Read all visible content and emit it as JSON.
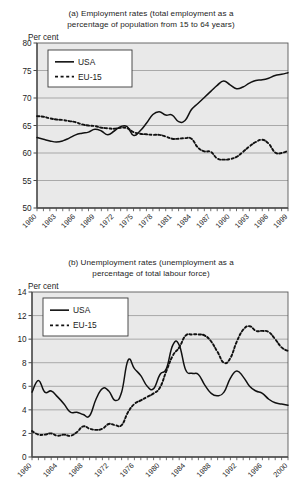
{
  "charts": [
    {
      "id": "employment-rates",
      "title_line1": "(a) Employment rates (total employment as a",
      "title_line2": "percentage of population from 15 to 64 years)",
      "unit_label": "Per cent",
      "legend": [
        {
          "label": "USA",
          "style": "solid"
        },
        {
          "label": "EU-15",
          "style": "dashed"
        }
      ]
    },
    {
      "id": "unemployment-rates",
      "title_line1": "(b) Unemployment rates (unemployment as a",
      "title_line2": "percentage of total labour force)",
      "unit_label": "Per cent",
      "legend": [
        {
          "label": "USA",
          "style": "solid"
        },
        {
          "label": "EU-15",
          "style": "dashed"
        }
      ]
    }
  ],
  "chart_data": [
    {
      "type": "line",
      "title": "(a) Employment rates (total employment as a percentage of population from 15 to 64 years)",
      "xlabel": "",
      "ylabel": "Per cent",
      "ylim": [
        50,
        80
      ],
      "yticks": [
        50,
        55,
        60,
        65,
        70,
        75,
        80
      ],
      "xlim": [
        1960,
        1999
      ],
      "xticks": [
        1960,
        1963,
        1966,
        1969,
        1972,
        1975,
        1978,
        1981,
        1984,
        1987,
        1990,
        1993,
        1996,
        1999
      ],
      "grid": true,
      "legend_position": "top-left",
      "x": [
        1960,
        1961,
        1962,
        1963,
        1964,
        1965,
        1966,
        1967,
        1968,
        1969,
        1970,
        1971,
        1972,
        1973,
        1974,
        1975,
        1976,
        1977,
        1978,
        1979,
        1980,
        1981,
        1982,
        1983,
        1984,
        1985,
        1986,
        1987,
        1988,
        1989,
        1990,
        1991,
        1992,
        1993,
        1994,
        1995,
        1996,
        1997,
        1998,
        1999
      ],
      "series": [
        {
          "name": "USA",
          "style": "solid",
          "values": [
            62.8,
            62.5,
            62.2,
            62.0,
            62.2,
            62.7,
            63.3,
            63.6,
            63.8,
            64.3,
            64.0,
            63.3,
            64.0,
            64.8,
            64.8,
            63.2,
            64.0,
            65.4,
            67.0,
            67.5,
            66.9,
            66.9,
            65.7,
            65.9,
            67.9,
            69.0,
            70.1,
            71.2,
            72.3,
            73.1,
            72.4,
            71.7,
            72.0,
            72.7,
            73.2,
            73.3,
            73.6,
            74.1,
            74.3,
            74.6
          ]
        },
        {
          "name": "EU-15",
          "style": "dashed",
          "values": [
            66.7,
            66.6,
            66.3,
            66.1,
            66.0,
            65.8,
            65.6,
            65.2,
            65.0,
            64.9,
            64.6,
            64.5,
            64.4,
            64.6,
            64.5,
            63.8,
            63.5,
            63.4,
            63.3,
            63.3,
            63.0,
            62.6,
            62.6,
            62.7,
            62.6,
            61.0,
            60.3,
            60.2,
            59.0,
            58.8,
            58.9,
            59.3,
            60.2,
            61.2,
            62.0,
            62.4,
            61.7,
            60.1,
            60.0,
            60.4
          ]
        }
      ]
    },
    {
      "type": "line",
      "title": "(b) Unemployment rates (unemployment as a percentage of total labour force)",
      "xlabel": "",
      "ylabel": "Per cent",
      "ylim": [
        0,
        14
      ],
      "yticks": [
        0,
        2,
        4,
        6,
        8,
        10,
        12,
        14
      ],
      "xlim": [
        1960,
        2000
      ],
      "xticks": [
        1960,
        1964,
        1968,
        1972,
        1976,
        1980,
        1984,
        1988,
        1992,
        1996,
        2000
      ],
      "grid": true,
      "legend_position": "top-left",
      "x": [
        1960,
        1961,
        1962,
        1963,
        1964,
        1965,
        1966,
        1967,
        1968,
        1969,
        1970,
        1971,
        1972,
        1973,
        1974,
        1975,
        1976,
        1977,
        1978,
        1979,
        1980,
        1981,
        1982,
        1983,
        1984,
        1985,
        1986,
        1987,
        1988,
        1989,
        1990,
        1991,
        1992,
        1993,
        1994,
        1995,
        1996,
        1997,
        1998,
        1999,
        2000
      ],
      "series": [
        {
          "name": "USA",
          "style": "solid",
          "values": [
            5.5,
            6.5,
            5.5,
            5.6,
            5.1,
            4.5,
            3.8,
            3.8,
            3.6,
            3.5,
            4.9,
            5.8,
            5.6,
            4.8,
            5.5,
            8.2,
            7.5,
            6.9,
            6.0,
            5.8,
            7.0,
            7.5,
            9.5,
            9.5,
            7.4,
            7.1,
            7.0,
            6.1,
            5.4,
            5.2,
            5.5,
            6.7,
            7.3,
            6.8,
            6.0,
            5.6,
            5.4,
            4.9,
            4.6,
            4.5,
            4.4
          ]
        },
        {
          "name": "EU-15",
          "style": "dashed",
          "values": [
            2.2,
            1.9,
            1.9,
            2.0,
            1.8,
            1.9,
            1.8,
            2.1,
            2.6,
            2.4,
            2.3,
            2.4,
            2.8,
            2.7,
            2.7,
            3.8,
            4.5,
            4.8,
            5.1,
            5.4,
            5.9,
            7.3,
            8.6,
            9.3,
            10.3,
            10.4,
            10.4,
            10.3,
            9.8,
            8.9,
            8.0,
            8.4,
            9.8,
            10.8,
            11.1,
            10.7,
            10.7,
            10.6,
            10.0,
            9.3,
            9.0
          ]
        }
      ]
    }
  ]
}
